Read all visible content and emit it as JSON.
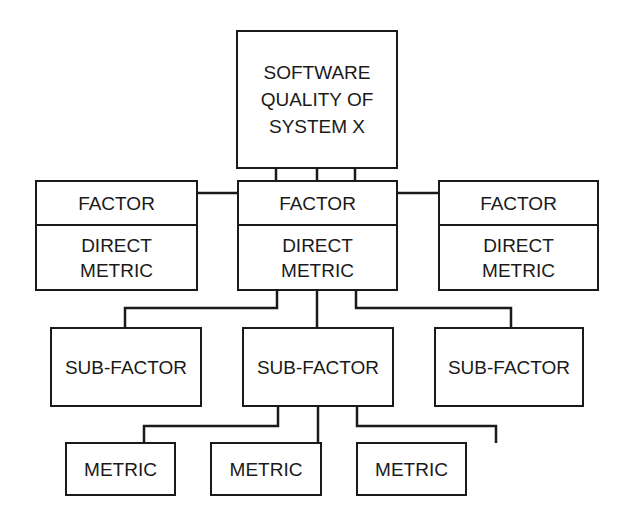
{
  "root": {
    "lines": [
      "SOFTWARE",
      "QUALITY OF",
      "SYSTEM X"
    ]
  },
  "factors": [
    {
      "title": "FACTOR",
      "metric": [
        "DIRECT",
        "METRIC"
      ]
    },
    {
      "title": "FACTOR",
      "metric": [
        "DIRECT",
        "METRIC"
      ]
    },
    {
      "title": "FACTOR",
      "metric": [
        "DIRECT",
        "METRIC"
      ]
    }
  ],
  "sub_factors": [
    {
      "label": "SUB-FACTOR"
    },
    {
      "label": "SUB-FACTOR"
    },
    {
      "label": "SUB-FACTOR"
    }
  ],
  "metrics": [
    {
      "label": "METRIC"
    },
    {
      "label": "METRIC"
    },
    {
      "label": "METRIC"
    }
  ]
}
